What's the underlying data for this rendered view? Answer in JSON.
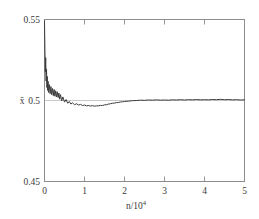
{
  "figure": {
    "background": "#ffffff",
    "frame_color": "#8c8c8c",
    "line_color": "#3c3c3c",
    "refline_color": "#c9c9c9"
  },
  "axes": {
    "y_axis_title": "x̄",
    "x_axis_title_base": "n/10",
    "x_axis_title_exponent": "4",
    "y_ticks": [
      "0.45",
      "0.5",
      "0.55"
    ],
    "x_ticks": [
      "0",
      "1",
      "2",
      "3",
      "4",
      "5"
    ]
  },
  "chart_data": {
    "type": "line",
    "title": "",
    "xlabel": "n/10^4",
    "ylabel": "x̄",
    "xlim": [
      0,
      5
    ],
    "ylim": [
      0.45,
      0.55
    ],
    "grid": false,
    "legend": null,
    "xticks": [
      0,
      1,
      2,
      3,
      4,
      5
    ],
    "yticks": [
      0.45,
      0.5,
      0.55
    ],
    "reference_line_y": 0.5,
    "series": [
      {
        "name": "running mean",
        "x": [
          0.0,
          0.01,
          0.02,
          0.03,
          0.04,
          0.05,
          0.06,
          0.07,
          0.08,
          0.09,
          0.1,
          0.12,
          0.14,
          0.16,
          0.18,
          0.2,
          0.22,
          0.24,
          0.26,
          0.28,
          0.3,
          0.32,
          0.34,
          0.36,
          0.38,
          0.4,
          0.43,
          0.46,
          0.5,
          0.54,
          0.58,
          0.62,
          0.66,
          0.7,
          0.75,
          0.8,
          0.85,
          0.9,
          0.95,
          1.0,
          1.05,
          1.1,
          1.15,
          1.2,
          1.25,
          1.3,
          1.35,
          1.4,
          1.45,
          1.5,
          1.55,
          1.6,
          1.65,
          1.7,
          1.75,
          1.8,
          1.85,
          1.9,
          1.95,
          2.0,
          2.1,
          2.2,
          2.3,
          2.4,
          2.5,
          2.6,
          2.7,
          2.8,
          2.9,
          3.0,
          3.1,
          3.2,
          3.3,
          3.4,
          3.5,
          3.6,
          3.7,
          3.8,
          3.9,
          4.0,
          4.1,
          4.2,
          4.3,
          4.4,
          4.5,
          4.6,
          4.7,
          4.8,
          4.9,
          5.0
        ],
        "y": [
          0.5492,
          0.532,
          0.5175,
          0.5265,
          0.512,
          0.5195,
          0.508,
          0.5148,
          0.5062,
          0.5118,
          0.505,
          0.5098,
          0.5042,
          0.5086,
          0.5036,
          0.5074,
          0.503,
          0.5068,
          0.5026,
          0.506,
          0.5022,
          0.5054,
          0.5018,
          0.5046,
          0.5008,
          0.5036,
          0.4998,
          0.5022,
          0.499,
          0.5006,
          0.4983,
          0.4994,
          0.4978,
          0.4986,
          0.4974,
          0.498,
          0.4972,
          0.4976,
          0.4969,
          0.4972,
          0.4967,
          0.4969,
          0.4966,
          0.4968,
          0.4965,
          0.4967,
          0.4967,
          0.497,
          0.4969,
          0.4973,
          0.4974,
          0.4978,
          0.498,
          0.4983,
          0.4984,
          0.4987,
          0.4988,
          0.4991,
          0.4992,
          0.4994,
          0.4996,
          0.4999,
          0.5,
          0.5002,
          0.5001,
          0.5003,
          0.5002,
          0.5004,
          0.5002,
          0.5003,
          0.5002,
          0.5004,
          0.5003,
          0.5005,
          0.5003,
          0.5005,
          0.5004,
          0.5006,
          0.5004,
          0.5005,
          0.5004,
          0.5006,
          0.5005,
          0.5007,
          0.5005,
          0.5006,
          0.5004,
          0.5005,
          0.5003,
          0.5004
        ]
      }
    ]
  }
}
